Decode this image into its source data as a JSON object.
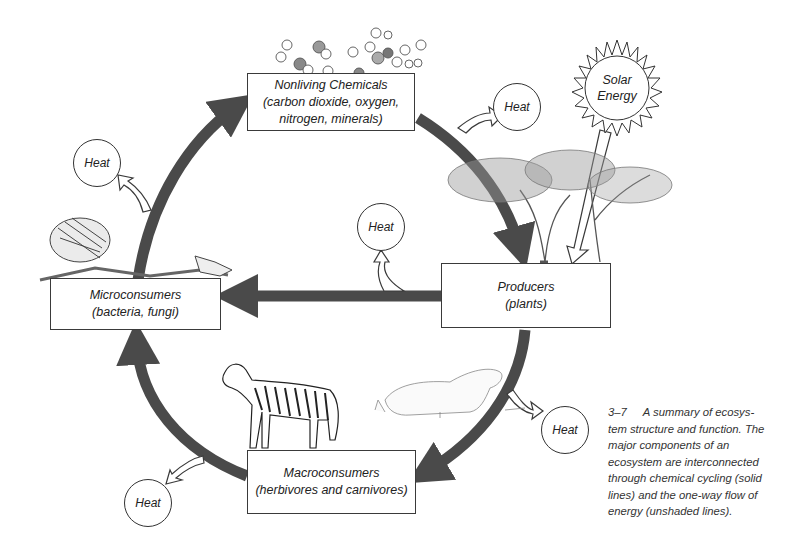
{
  "figure": {
    "number": "3–7",
    "caption": "A summary of ecosystem structure and function. The major components of an ecosystem are interconnected through chemical cycling (solid lines) and the one-way flow of energy (unshaded lines).",
    "caption_lines": [
      "A summary of ecosys-",
      "tem structure and function. The",
      "major components of an",
      "ecosystem are interconnected",
      "through chemical cycling (solid",
      "lines) and the one-way flow of",
      "energy (unshaded lines)."
    ]
  },
  "nodes": {
    "nonliving": {
      "title": "Nonliving Chemicals",
      "line2": "(carbon dioxide, oxygen,",
      "line3": "nitrogen, minerals)"
    },
    "producers": {
      "title": "Producers",
      "line2": "(plants)"
    },
    "microconsumers": {
      "title": "Microconsumers",
      "line2": "(bacteria, fungi)"
    },
    "macroconsumers": {
      "title": "Macroconsumers",
      "line2": "(herbivores and carnivores)"
    },
    "sun": {
      "line1": "Solar",
      "line2": "Energy"
    }
  },
  "heat_nodes": [
    {
      "label": "Heat",
      "source": "nonliving-to-producers"
    },
    {
      "label": "Heat",
      "source": "microconsumers-to-nonliving"
    },
    {
      "label": "Heat",
      "source": "producers-to-microconsumers"
    },
    {
      "label": "Heat",
      "source": "producers-to-macroconsumers"
    },
    {
      "label": "Heat",
      "source": "macroconsumers-to-microconsumers"
    }
  ],
  "flows": {
    "chemical_cycling": [
      "Nonliving Chemicals → Producers",
      "Producers → Microconsumers",
      "Producers → Macroconsumers",
      "Macroconsumers → Microconsumers",
      "Microconsumers → Nonliving Chemicals"
    ],
    "energy_flow": [
      "Solar Energy → Producers",
      "each transfer → Heat"
    ]
  },
  "illustrations": [
    "molecules",
    "acacia-trees",
    "skeleton",
    "zebra",
    "lioness"
  ],
  "colors": {
    "cycle_arrow": "#4a4a4a",
    "energy_arrow_fill": "#ffffff",
    "outline": "#333333"
  }
}
